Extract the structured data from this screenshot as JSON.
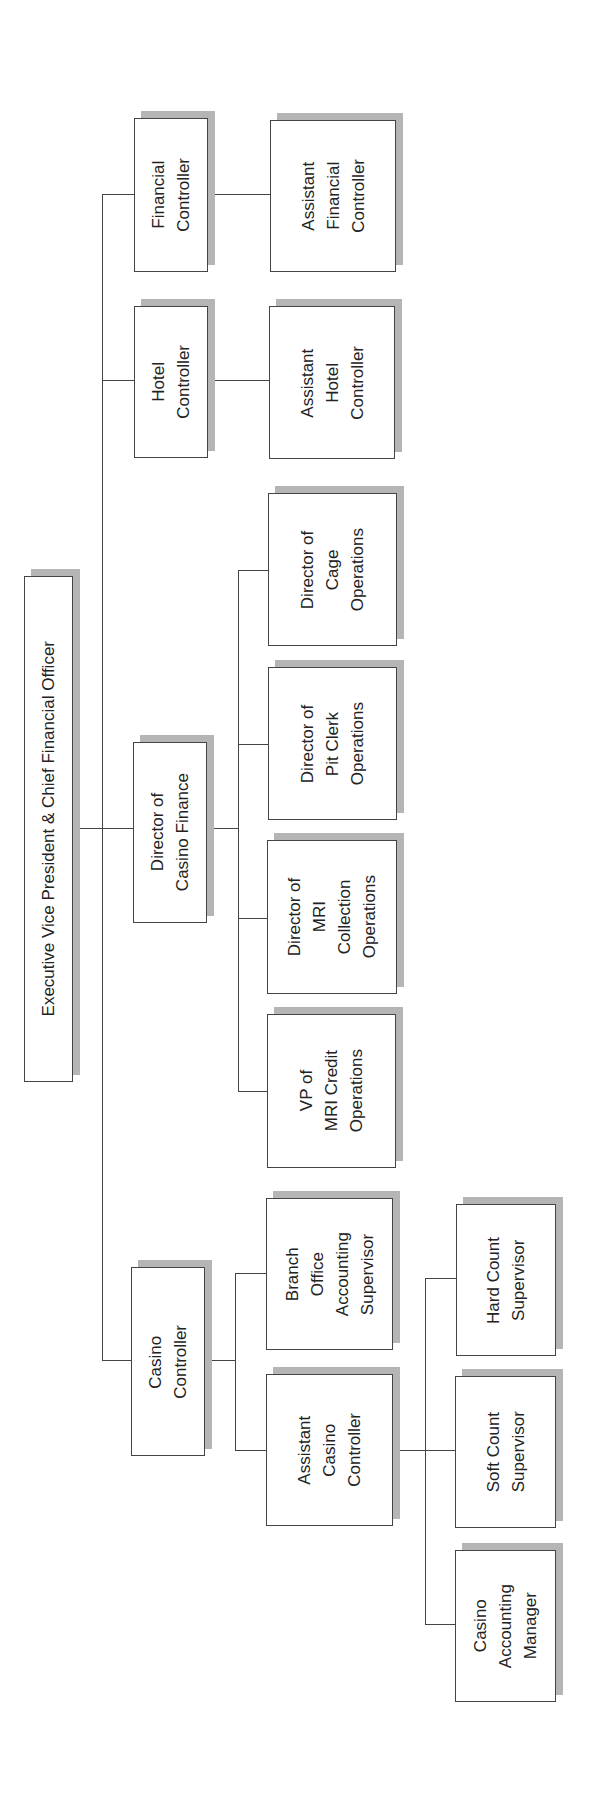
{
  "chart_title": "",
  "root": {
    "label": "Executive Vice President & Chief Financial Officer"
  },
  "level1": [
    {
      "label": "Financial\nController"
    },
    {
      "label": "Hotel\nController"
    },
    {
      "label": "Director of\nCasino Finance"
    },
    {
      "label": "Casino\nController"
    }
  ],
  "financial_children": [
    {
      "label": "Assistant\nFinancial\nController"
    }
  ],
  "hotel_children": [
    {
      "label": "Assistant\nHotel\nController"
    }
  ],
  "casino_finance_children": [
    {
      "label": "Director of\nCage\nOperations"
    },
    {
      "label": "Director of\nPit Clerk\nOperations"
    },
    {
      "label": "Director of\nMRI\nCollection\nOperations"
    },
    {
      "label": "VP of\nMRI Credit\nOperations"
    }
  ],
  "casino_controller_children": [
    {
      "label": "Branch\nOffice\nAccounting\nSupervisor"
    },
    {
      "label": "Assistant\nCasino\nController"
    }
  ],
  "assistant_casino_children": [
    {
      "label": "Hard Count\nSupervisor"
    },
    {
      "label": "Soft Count\nSupervisor"
    },
    {
      "label": "Casino\nAccounting\nManager"
    }
  ],
  "colors": {
    "line": "#444444",
    "shadow": "#b5b5b5",
    "box_fill": "#ffffff"
  }
}
